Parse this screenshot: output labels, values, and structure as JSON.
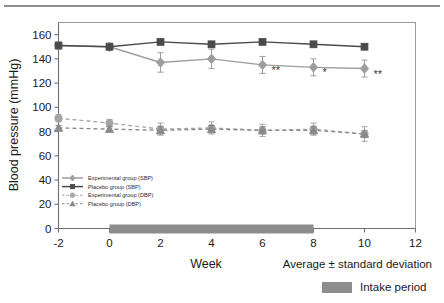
{
  "figure": {
    "top_divider": "horizontal-rule"
  },
  "chart_data": {
    "type": "line",
    "title": "",
    "xlabel": "Week",
    "ylabel": "Blood pressure (mmHg)",
    "x": [
      -2,
      0,
      2,
      4,
      6,
      8,
      10
    ],
    "xlim": [
      -2,
      12
    ],
    "ylim": [
      0,
      170
    ],
    "xticks": [
      -2,
      0,
      2,
      4,
      6,
      8,
      10,
      12
    ],
    "xticklabels": [
      "-2",
      "0",
      "2",
      "4",
      "6",
      "8",
      "10",
      "12"
    ],
    "yticks": [
      0,
      20,
      40,
      60,
      80,
      100,
      120,
      140,
      160
    ],
    "yticklabels": [
      "0",
      "20",
      "40",
      "60",
      "80",
      "100",
      "120",
      "140",
      "160"
    ],
    "grid": false,
    "legend_position": "inner-lower-left",
    "errorbars": true,
    "series": [
      {
        "name": "Experimental group (SBP)",
        "marker": "diamond",
        "linestyle": "solid",
        "color": "#9d9d9d",
        "values": [
          151,
          150,
          137,
          140,
          135,
          133,
          132
        ],
        "errors": [
          3,
          3,
          8,
          8,
          7,
          7,
          7
        ]
      },
      {
        "name": "Placebo group (SBP)",
        "marker": "square",
        "linestyle": "solid",
        "color": "#4a4a4a",
        "values": [
          151,
          150,
          154,
          152,
          154,
          152,
          150
        ],
        "errors": [
          2,
          2,
          2,
          2,
          2,
          2,
          2
        ]
      },
      {
        "name": "Experimental group (DBP)",
        "marker": "circle",
        "linestyle": "dashed",
        "color": "#a5a5a5",
        "values": [
          91,
          87,
          82,
          83,
          81,
          82,
          78
        ],
        "errors": [
          3,
          3,
          5,
          5,
          5,
          5,
          6
        ]
      },
      {
        "name": "Placebo group (DBP)",
        "marker": "triangle",
        "linestyle": "dashed",
        "color": "#8a8a8a",
        "values": [
          83,
          82,
          81,
          82,
          81,
          81,
          78
        ],
        "errors": [
          2,
          2,
          3,
          3,
          3,
          3,
          3
        ]
      }
    ],
    "annotations": [
      {
        "x": 6,
        "text": "**",
        "series": "Experimental group (SBP)"
      },
      {
        "x": 8,
        "text": "*",
        "series": "Experimental group (SBP)"
      },
      {
        "x": 10,
        "text": "**",
        "series": "Experimental group (SBP)"
      }
    ],
    "intake_period": {
      "label": "Intake period",
      "from": 0,
      "to": 8,
      "color": "#8d8d8d"
    },
    "notes": {
      "average_note": "Average ± standard deviation"
    }
  },
  "legend": {
    "items": [
      {
        "label": "Experimental group (SBP)"
      },
      {
        "label": "Placebo group (SBP)"
      },
      {
        "label": "Experimental group (DBP)"
      },
      {
        "label": "Placebo group (DBP)"
      }
    ]
  }
}
